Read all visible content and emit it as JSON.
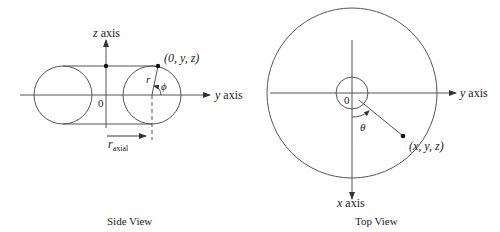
{
  "side_view": {
    "title": "Side View",
    "z_axis_label_var": "z",
    "z_axis_label_word": " axis",
    "y_axis_label_var": "y",
    "y_axis_label_word": " axis",
    "origin_label": "0",
    "point_label": "(0, y, z)",
    "r_label": "r",
    "phi_label": "ϕ",
    "r_axial_main": "r",
    "r_axial_sub": "axial"
  },
  "top_view": {
    "title": "Top View",
    "y_axis_label_var": "y",
    "y_axis_label_word": " axis",
    "x_axis_label_var": "x",
    "x_axis_label_word": " axis",
    "origin_label": "0",
    "theta_label": "θ",
    "point_label": "(x, y, z)"
  },
  "colors": {
    "stroke": "#555555",
    "text": "#222222",
    "background": "#ffffff"
  }
}
